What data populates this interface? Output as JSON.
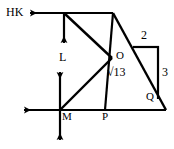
{
  "figure": {
    "type": "geometry-diagram",
    "background_color": "#ffffff",
    "stroke_color": "#000000",
    "labels": {
      "hk": "HK",
      "l": "L",
      "o": "O",
      "root13": "√13",
      "two": "2",
      "three": "3",
      "q": "Q",
      "m": "M",
      "p": "P"
    },
    "points": {
      "top_left_vertex": [
        64,
        13
      ],
      "top_right_vertex": [
        113,
        13
      ],
      "o": [
        112,
        58
      ],
      "q": [
        148,
        98
      ],
      "m": [
        60,
        110
      ],
      "p": [
        105,
        110
      ],
      "bottom_right": [
        166,
        110
      ],
      "rect_top_left": [
        133,
        47
      ],
      "rect_top_right": [
        158,
        47
      ],
      "rect_bottom_right": [
        158,
        98
      ]
    },
    "segments": [
      "top-horizontal-line",
      "down-arrow-from-top-vertex",
      "diagonal-top-vertex-to-O",
      "vertical-O-to-P",
      "diagonal-top-right-to-bottom-right",
      "diagonal-O-to-M",
      "bottom-horizontal-line",
      "rect-horizontal-2",
      "rect-vertical-3",
      "left-arrow-top",
      "left-arrow-bottom",
      "up-arrow-at-M",
      "down-arrow-at-M"
    ]
  }
}
